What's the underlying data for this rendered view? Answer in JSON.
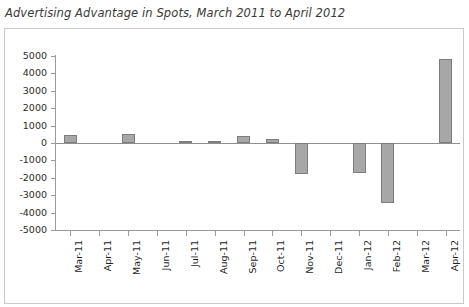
{
  "chart": {
    "title": "Advertising Advantage in Spots, March 2011 to April 2012"
  },
  "chart_data": {
    "type": "bar",
    "title": "Advertising Advantage in Spots, March 2011 to April 2012",
    "xlabel": "",
    "ylabel": "",
    "ylim": [
      -5000,
      5000
    ],
    "ytick_step": 1000,
    "grid": false,
    "legend": false,
    "bar_color": "#a7a7a7",
    "bar_edge_color": "#7d7d7d",
    "categories": [
      "Mar-11",
      "Apr-11",
      "May-11",
      "Jun-11",
      "Jul-11",
      "Aug-11",
      "Sep-11",
      "Oct-11",
      "Nov-11",
      "Dec-11",
      "Jan-12",
      "Feb-12",
      "Mar-12",
      "Apr-12"
    ],
    "values": [
      450,
      0,
      500,
      0,
      100,
      120,
      400,
      230,
      -1800,
      0,
      -1750,
      -3450,
      0,
      4800
    ],
    "ytick_labels": [
      "5000",
      "4000",
      "3000",
      "2000",
      "1000",
      "0",
      "-1000",
      "-2000",
      "-3000",
      "-4000",
      "-5000"
    ],
    "ytick_values": [
      5000,
      4000,
      3000,
      2000,
      1000,
      0,
      -1000,
      -2000,
      -3000,
      -4000,
      -5000
    ]
  }
}
